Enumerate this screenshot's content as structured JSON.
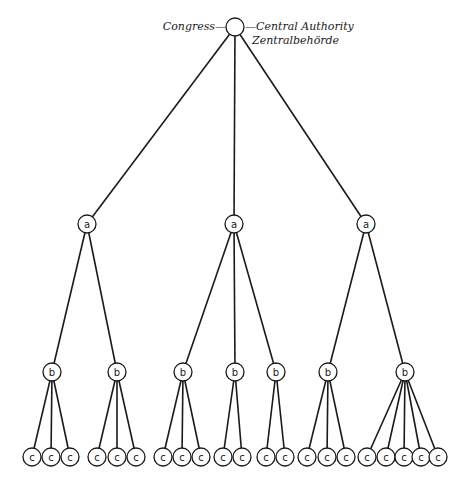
{
  "diagram": {
    "type": "hierarchy-tree",
    "root": {
      "label_left": "Congress—",
      "label_right_line1": "—Central Authority",
      "label_right_line2": "Zentralbehörde",
      "x": 235,
      "y": 27,
      "r": 9
    },
    "level_a": {
      "label": "a",
      "nodes": [
        {
          "x": 87,
          "y": 224
        },
        {
          "x": 234,
          "y": 224
        },
        {
          "x": 366,
          "y": 224
        }
      ]
    },
    "level_b": {
      "label": "b",
      "nodes": [
        {
          "x": 52,
          "y": 372,
          "parent": 0
        },
        {
          "x": 117,
          "y": 372,
          "parent": 0
        },
        {
          "x": 183,
          "y": 372,
          "parent": 1
        },
        {
          "x": 235,
          "y": 372,
          "parent": 1
        },
        {
          "x": 276,
          "y": 372,
          "parent": 1
        },
        {
          "x": 328,
          "y": 372,
          "parent": 2
        },
        {
          "x": 405,
          "y": 372,
          "parent": 2
        }
      ]
    },
    "level_c": {
      "label": "c",
      "nodes": [
        {
          "x": 32,
          "parent": 0
        },
        {
          "x": 51,
          "parent": 0
        },
        {
          "x": 70,
          "parent": 0
        },
        {
          "x": 97,
          "parent": 1
        },
        {
          "x": 117,
          "parent": 1
        },
        {
          "x": 136,
          "parent": 1
        },
        {
          "x": 163,
          "parent": 2
        },
        {
          "x": 182,
          "parent": 2
        },
        {
          "x": 201,
          "parent": 2
        },
        {
          "x": 223,
          "parent": 3
        },
        {
          "x": 242,
          "parent": 3
        },
        {
          "x": 266,
          "parent": 4
        },
        {
          "x": 285,
          "parent": 4
        },
        {
          "x": 307,
          "parent": 5
        },
        {
          "x": 327,
          "parent": 5
        },
        {
          "x": 346,
          "parent": 5
        },
        {
          "x": 367,
          "parent": 6
        },
        {
          "x": 386,
          "parent": 6
        },
        {
          "x": 404,
          "parent": 6
        },
        {
          "x": 421,
          "parent": 6
        },
        {
          "x": 438,
          "parent": 6
        }
      ],
      "y": 457
    },
    "node_radius": 9
  }
}
